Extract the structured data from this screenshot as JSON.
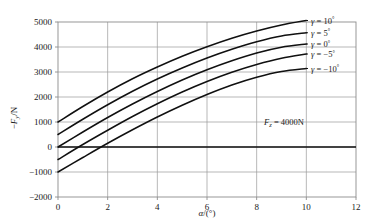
{
  "chart_data": {
    "type": "line",
    "title": "",
    "xlabel": "α /(°)",
    "ylabel": "−Fᵧ /N",
    "xlim": [
      0,
      12
    ],
    "ylim": [
      -2000,
      5000
    ],
    "xticks": [
      0,
      2,
      4,
      6,
      8,
      10,
      12
    ],
    "xtick_labels": [
      "0",
      "2",
      "4",
      "6",
      "8",
      "10",
      "12"
    ],
    "yticks": [
      -2000,
      -1000,
      0,
      1000,
      2000,
      3000,
      4000,
      5000
    ],
    "ytick_labels": [
      "−2000",
      "−1000",
      "0",
      "1000",
      "2000",
      "3000",
      "4000",
      "5000"
    ],
    "grid": true,
    "grid_color": "#9a9a9a",
    "zero_line_emphasis": true,
    "legend_position": "right-outside",
    "x": [
      0,
      1,
      2,
      3,
      4,
      5,
      6,
      7,
      8,
      9,
      10
    ],
    "series": [
      {
        "name": "γ = 10°",
        "gamma_deg": 10,
        "values": [
          1000,
          1620,
          2200,
          2730,
          3200,
          3630,
          4010,
          4350,
          4640,
          4880,
          5060
        ]
      },
      {
        "name": "γ = 5°",
        "gamma_deg": 5,
        "values": [
          500,
          1110,
          1690,
          2230,
          2720,
          3160,
          3560,
          3910,
          4210,
          4440,
          4570
        ]
      },
      {
        "name": "γ = 0°",
        "gamma_deg": 0,
        "values": [
          0,
          600,
          1180,
          1720,
          2220,
          2680,
          3090,
          3450,
          3760,
          3990,
          4120
        ]
      },
      {
        "name": "γ = −5°",
        "gamma_deg": -5,
        "values": [
          -500,
          100,
          670,
          1220,
          1730,
          2200,
          2620,
          2990,
          3300,
          3550,
          3720
        ]
      },
      {
        "name": "γ = −10°",
        "gamma_deg": -10,
        "values": [
          -1000,
          -420,
          150,
          690,
          1200,
          1670,
          2100,
          2480,
          2790,
          3020,
          3140
        ]
      }
    ],
    "annotations": [
      {
        "id": "load-annotation",
        "text": "F₂ = 4000N",
        "text_parts": {
          "symbol": "F",
          "subscript": "z",
          "equals_value": "= 4000N"
        },
        "x": 9.1,
        "y": 1000
      }
    ]
  },
  "axes": {
    "y_axis_label_parts": {
      "minus": "−",
      "symbol": "F",
      "subscript": "y",
      "unit": "/N"
    },
    "x_axis_label_parts": {
      "symbol": "α",
      "unit": "/(°)"
    }
  },
  "legend": {
    "entries": [
      {
        "label": "γ = 10°",
        "symbol": "γ",
        "equals": "=",
        "value": "10",
        "degree": "°"
      },
      {
        "label": "γ = 5°",
        "symbol": "γ",
        "equals": "=",
        "value": "5",
        "degree": "°"
      },
      {
        "label": "γ = 0°",
        "symbol": "γ",
        "equals": "=",
        "value": "0",
        "degree": "°"
      },
      {
        "label": "γ = −5°",
        "symbol": "γ",
        "equals": "=",
        "value": "−5",
        "degree": "°"
      },
      {
        "label": "γ = −10°",
        "symbol": "γ",
        "equals": "=",
        "value": "−10",
        "degree": "°"
      }
    ]
  },
  "style": {
    "curve_color": "#101010",
    "grid_color": "#9a9a9a",
    "frame_color": "#8c8c8c",
    "text_color": "#1a1a1a",
    "background": "#ffffff"
  }
}
